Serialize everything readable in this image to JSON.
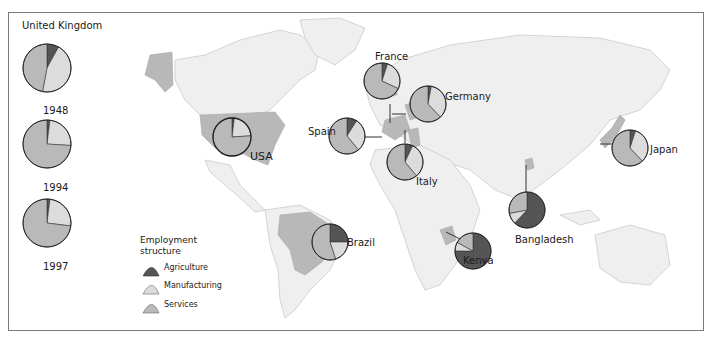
{
  "figure": {
    "uk_panel": {
      "title": "United Kingdom",
      "years": [
        "1948",
        "1994",
        "1997"
      ]
    },
    "legend": {
      "title_line1": "Employment",
      "title_line2": "structure",
      "items": [
        {
          "label": "Agriculture",
          "color": "#555555"
        },
        {
          "label": "Manufacturing",
          "color": "#dcdcdc"
        },
        {
          "label": "Services",
          "color": "#b9b9b9"
        }
      ]
    },
    "countries": {
      "usa": "USA",
      "france": "France",
      "germany": "Germany",
      "spain": "Spain",
      "italy": "Italy",
      "brazil": "Brazil",
      "kenya": "Kenya",
      "bangladesh": "Bangladesh",
      "japan": "Japan"
    }
  },
  "chart_data": {
    "type": "pie",
    "title": "Employment structure",
    "categories": [
      "Agriculture",
      "Manufacturing",
      "Services"
    ],
    "colors": {
      "Agriculture": "#555555",
      "Manufacturing": "#dcdcdc",
      "Services": "#b9b9b9"
    },
    "series": [
      {
        "name": "United Kingdom 1948",
        "values": [
          8,
          45,
          47
        ]
      },
      {
        "name": "United Kingdom 1994",
        "values": [
          2,
          24,
          74
        ]
      },
      {
        "name": "United Kingdom 1997",
        "values": [
          2,
          25,
          73
        ]
      },
      {
        "name": "USA",
        "values": [
          2,
          22,
          76
        ]
      },
      {
        "name": "France",
        "values": [
          5,
          27,
          68
        ]
      },
      {
        "name": "Germany",
        "values": [
          3,
          35,
          62
        ]
      },
      {
        "name": "Spain",
        "values": [
          9,
          30,
          61
        ]
      },
      {
        "name": "Italy",
        "values": [
          7,
          32,
          61
        ]
      },
      {
        "name": "Brazil",
        "values": [
          25,
          20,
          55
        ]
      },
      {
        "name": "Kenya",
        "values": [
          75,
          8,
          17
        ]
      },
      {
        "name": "Bangladesh",
        "values": [
          62,
          10,
          28
        ]
      },
      {
        "name": "Japan",
        "values": [
          5,
          33,
          62
        ]
      }
    ],
    "legend_position": "bottom-left"
  }
}
